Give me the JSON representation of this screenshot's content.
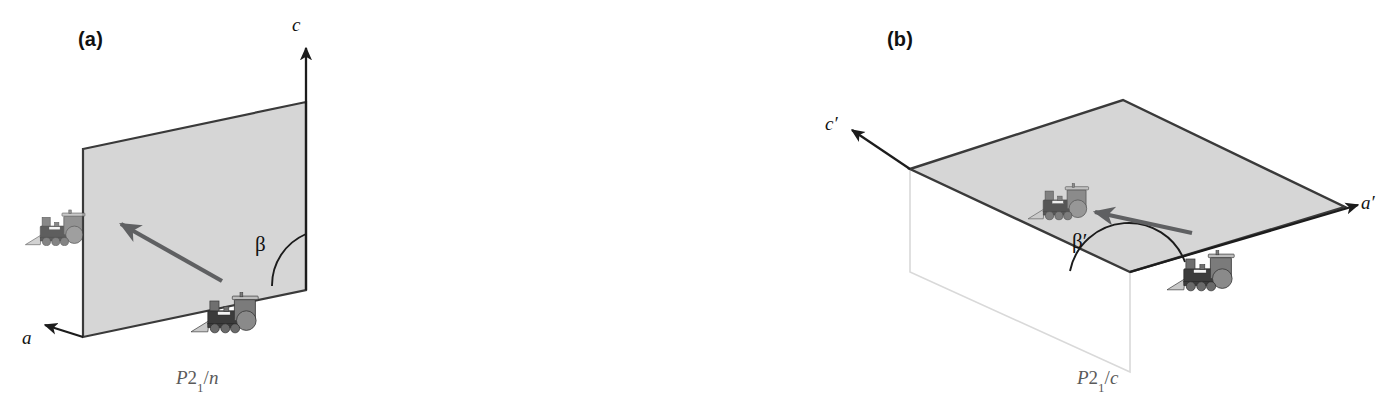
{
  "figure": {
    "kind": "crystallographic-diagram",
    "background_color": "#ffffff"
  },
  "panels": [
    {
      "id": "a",
      "label": "(a)",
      "spacegroup": {
        "letter": "P",
        "number": "2",
        "subscript": "1",
        "slash": "/",
        "glide": "n",
        "full": "P21/n"
      },
      "axes": [
        {
          "name": "c-axis",
          "label": "c",
          "direction": "up"
        },
        {
          "name": "a-axis",
          "label": "a",
          "direction": "down-left"
        }
      ],
      "angle": {
        "name": "beta",
        "label": "β"
      },
      "plane": {
        "orientation": "vertical",
        "fill": "#d6d6d6",
        "stroke": "#3a3a3a"
      },
      "motifs": [
        {
          "name": "locomotive-upper-left",
          "shaded": true,
          "facing": "left"
        },
        {
          "name": "locomotive-lower-right",
          "shaded": false,
          "facing": "left"
        }
      ],
      "symmetry_arrow": {
        "from": "locomotive-lower-right",
        "to": "locomotive-upper-left",
        "color": "#5f6062"
      }
    },
    {
      "id": "b",
      "label": "(b)",
      "spacegroup": {
        "letter": "P",
        "number": "2",
        "subscript": "1",
        "slash": "/",
        "glide": "c",
        "full": "P21/c"
      },
      "axes": [
        {
          "name": "c-prime-axis",
          "label": "c′",
          "direction": "up-left"
        },
        {
          "name": "a-prime-axis",
          "label": "a′",
          "direction": "right"
        }
      ],
      "angle": {
        "name": "beta-prime",
        "label": "β′"
      },
      "plane": {
        "orientation": "horizontal",
        "fill": "#d6d6d6",
        "stroke": "#3a3a3a"
      },
      "ghost_plane": {
        "orientation": "vertical",
        "fill": "none",
        "stroke": "#d9d9d9"
      },
      "motifs": [
        {
          "name": "locomotive-upper-left",
          "shaded": true,
          "facing": "left"
        },
        {
          "name": "locomotive-lower-right",
          "shaded": false,
          "facing": "left"
        }
      ],
      "symmetry_arrow": {
        "from": "locomotive-lower-right",
        "to": "locomotive-upper-left",
        "color": "#5f6062"
      }
    }
  ],
  "colors": {
    "plane_fill": "#d6d6d6",
    "plane_stroke": "#3a3a3a",
    "ghost_stroke": "#d9d9d9",
    "axis_stroke": "#1c1c1c",
    "arrow_gray": "#5f6062",
    "loco_dark": "#3b3b3b",
    "loco_mid": "#7b7b7b",
    "loco_light": "#b4b4b4",
    "text": "#111111",
    "caption_text": "#5a5a5a"
  }
}
